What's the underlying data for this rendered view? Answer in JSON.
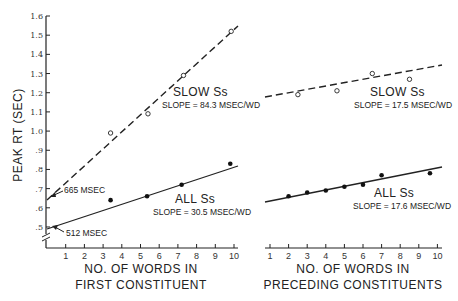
{
  "chart_data": [
    {
      "type": "scatter",
      "panel": "left",
      "title": "",
      "xlabel": "NO. OF WORDS IN FIRST CONSTITUENT",
      "xlabel_lines": [
        "NO. OF WORDS IN",
        "FIRST CONSTITUENT"
      ],
      "ylabel": "PEAK RT (SEC)",
      "xlim": [
        0,
        10.5
      ],
      "ylim": [
        0.45,
        1.6
      ],
      "x_ticks": [
        "1",
        "2",
        "3",
        "4",
        "5",
        "6",
        "7",
        "8",
        "9",
        "10"
      ],
      "y_ticks": [
        "1.6",
        "1.5",
        "1.4",
        "1.3",
        "1.2",
        "1.1",
        "1.0",
        ".9",
        ".8",
        ".7",
        ".6",
        ".5"
      ],
      "axis_break": true,
      "grid": false,
      "series": [
        {
          "name": "SLOW Ss",
          "marker": "open-circle",
          "line": "dashed",
          "slope_label": "SLOPE = 84.3 MSEC/WD",
          "intercept": 0.665,
          "slope": 0.0843,
          "points": [
            [
              3.4,
              0.99
            ],
            [
              5.4,
              1.09
            ],
            [
              7.3,
              1.29
            ],
            [
              9.85,
              1.52
            ]
          ]
        },
        {
          "name": "ALL Ss",
          "marker": "filled-circle",
          "line": "solid",
          "slope_label": "SLOPE = 30.5 MSEC/WD",
          "intercept": 0.512,
          "slope": 0.0305,
          "points": [
            [
              3.4,
              0.64
            ],
            [
              5.35,
              0.66
            ],
            [
              7.2,
              0.72
            ],
            [
              9.8,
              0.83
            ]
          ]
        }
      ],
      "annotations": [
        "665 MSEC",
        "512 MSEC"
      ]
    },
    {
      "type": "scatter",
      "panel": "right",
      "title": "",
      "xlabel": "NO. OF WORDS IN PRECEDING CONSTITUENTS",
      "xlabel_lines": [
        "NO. OF WORDS IN",
        "PRECEDING CONSTITUENTS"
      ],
      "ylabel": "",
      "xlim": [
        0.8,
        10.5
      ],
      "ylim": [
        0.45,
        1.6
      ],
      "x_ticks": [
        "1",
        "2",
        "3",
        "4",
        "5",
        "6",
        "7",
        "8",
        "9",
        "10"
      ],
      "grid": false,
      "series": [
        {
          "name": "SLOW Ss",
          "marker": "open-circle",
          "line": "dashed",
          "slope_label": "SLOPE = 17.5 MSEC/WD",
          "slope": 0.0175,
          "points": [
            [
              2.5,
              1.19
            ],
            [
              4.6,
              1.21
            ],
            [
              6.5,
              1.3
            ],
            [
              8.5,
              1.27
            ]
          ]
        },
        {
          "name": "ALL Ss",
          "marker": "filled-circle",
          "line": "solid",
          "slope_label": "SLOPE = 17.6 MSEC/WD",
          "slope": 0.0176,
          "points": [
            [
              2.0,
              0.66
            ],
            [
              3.0,
              0.68
            ],
            [
              4.0,
              0.69
            ],
            [
              5.0,
              0.71
            ],
            [
              6.0,
              0.72
            ],
            [
              7.0,
              0.77
            ],
            [
              9.6,
              0.78
            ]
          ]
        }
      ]
    }
  ],
  "labels": {
    "ylabel": "PEAK RT (SEC)",
    "left_xlabel_1": "NO. OF WORDS IN",
    "left_xlabel_2": "FIRST CONSTITUENT",
    "right_xlabel_1": "NO. OF WORDS IN",
    "right_xlabel_2": "PRECEDING CONSTITUENTS",
    "left_slow_name": "SLOW Ss",
    "left_slow_slope": "SLOPE = 84.3 MSEC/WD",
    "left_all_name": "ALL Ss",
    "left_all_slope": "SLOPE = 30.5 MSEC/WD",
    "right_slow_name": "SLOW Ss",
    "right_slow_slope": "SLOPE = 17.5 MSEC/WD",
    "right_all_name": "ALL Ss",
    "right_all_slope": "SLOPE = 17.6 MSEC/WD",
    "annot_665": "665 MSEC",
    "annot_512": "512 MSEC"
  },
  "y_tick_labels": [
    "1.6",
    "1.5",
    "1.4",
    "1.3",
    "1.2",
    "1.1",
    "1.0",
    ".9",
    ".8",
    ".7",
    ".6",
    ".5"
  ],
  "x_tick_labels": [
    "1",
    "2",
    "3",
    "4",
    "5",
    "6",
    "7",
    "8",
    "9",
    "10"
  ]
}
